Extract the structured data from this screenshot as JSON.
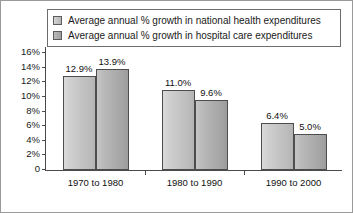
{
  "chart_data": {
    "type": "bar",
    "title": "",
    "xlabel": "",
    "ylabel": "",
    "ylim": [
      0,
      17
    ],
    "grid": false,
    "legend_position": "top",
    "categories": [
      "1970 to 1980",
      "1980 to 1990",
      "1990 to 2000"
    ],
    "ytick_labels": [
      "16%",
      "14%",
      "12%",
      "10%",
      "8%",
      "6%",
      "4%",
      "2%",
      "0"
    ],
    "ytick_values": [
      16,
      14,
      12,
      10,
      8,
      6,
      4,
      2,
      0
    ],
    "series": [
      {
        "name": "Average annual % growth in national health expenditures",
        "color": "#c4c4c4",
        "values": [
          12.9,
          11.0,
          6.4
        ],
        "value_labels": [
          "12.9%",
          "11.0%",
          "6.4%"
        ]
      },
      {
        "name": "Average annual % growth in hospital care expenditures",
        "color": "#adadad",
        "values": [
          13.9,
          9.6,
          5.0
        ],
        "value_labels": [
          "13.9%",
          "9.6%",
          "5.0%"
        ]
      }
    ]
  }
}
